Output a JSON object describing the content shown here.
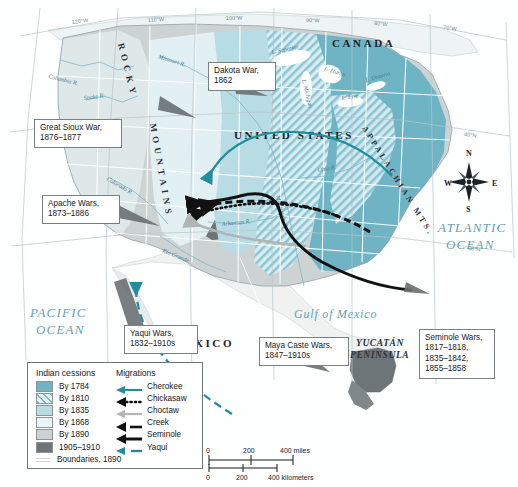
{
  "map": {
    "title": "Indian cessions and migrations map",
    "countries": [
      {
        "name": "CANADA",
        "x": 332,
        "y": 47
      },
      {
        "name": "UNITED STATES",
        "x": 234,
        "y": 139
      },
      {
        "name": "MEXICO",
        "x": 172,
        "y": 347
      }
    ],
    "oceans": [
      {
        "name": "PACIFIC",
        "x": 47,
        "y": 317
      },
      {
        "name": "OCEAN",
        "x": 50,
        "y": 333
      },
      {
        "name": "ATLANTIC",
        "x": 452,
        "y": 232
      },
      {
        "name": "OCEAN",
        "x": 458,
        "y": 248
      }
    ],
    "gulf": {
      "name": "Gulf of Mexico",
      "x": 298,
      "y": 316
    },
    "peninsula": [
      {
        "name": "YUCATÁN",
        "x": 365,
        "y": 345
      },
      {
        "name": "PENINSULA",
        "x": 360,
        "y": 357
      }
    ],
    "ranges": [
      {
        "name": "ROCKY",
        "x": 123,
        "y": 48
      },
      {
        "name": "MOUNTAINS",
        "x": 152,
        "y": 130
      },
      {
        "name": "APPALACHIAN MTS.",
        "x": 366,
        "y": 133
      }
    ],
    "rivers": [
      {
        "name": "Columbia R.",
        "x": 62,
        "y": 73
      },
      {
        "name": "Missouri R.",
        "x": 175,
        "y": 60
      },
      {
        "name": "Snake R.",
        "x": 90,
        "y": 95
      },
      {
        "name": "Colorado R.",
        "x": 122,
        "y": 185
      },
      {
        "name": "Rio Grande",
        "x": 178,
        "y": 258
      },
      {
        "name": "Mississippi R.",
        "x": 285,
        "y": 202
      },
      {
        "name": "Ohio R.",
        "x": 330,
        "y": 178
      },
      {
        "name": "L. Superior",
        "x": 290,
        "y": 57
      },
      {
        "name": "L. Michigan",
        "x": 305,
        "y": 95
      },
      {
        "name": "L. Huron",
        "x": 332,
        "y": 78
      },
      {
        "name": "L. Erie",
        "x": 348,
        "y": 104
      },
      {
        "name": "L. Ontario",
        "x": 378,
        "y": 88
      },
      {
        "name": "Arkansas R.",
        "x": 240,
        "y": 230
      }
    ],
    "longitudes": [
      {
        "label": "120°W",
        "x": 78,
        "y": 21
      },
      {
        "label": "110°W",
        "x": 155,
        "y": 21
      },
      {
        "label": "100°W",
        "x": 232,
        "y": 21
      },
      {
        "label": "90°W",
        "x": 312,
        "y": 21
      },
      {
        "label": "80°W",
        "x": 379,
        "y": 22
      },
      {
        "label": "70°W",
        "x": 448,
        "y": 23
      }
    ],
    "latitudes": [
      {
        "label": "40°N",
        "x": 470,
        "y": 134
      },
      {
        "label": "30°N",
        "x": 474,
        "y": 247
      }
    ],
    "compass": {
      "n": "N",
      "e": "E",
      "s": "S",
      "w": "W",
      "cx": 469,
      "cy": 182
    },
    "scale": {
      "miles_ticks": [
        "0",
        "200",
        "400 miles"
      ],
      "km_ticks": [
        "0",
        "200",
        "400 kilometers"
      ]
    },
    "colors": {
      "cession_1784": "#6fb4c4",
      "cession_1810": "#a9d4dd",
      "cession_1835": "#b8dce4",
      "cession_1868": "#dff0f4",
      "cession_1890": "#cdd2d2",
      "cession_1905": "#6e7578",
      "land_base": "#e9eff0",
      "water": "#ffffff",
      "accent_teal": "#1f8f9e",
      "migration_black": "#121212",
      "migration_gray": "#b0b5b6"
    }
  },
  "callouts": [
    {
      "id": "dakota-war",
      "text": "Dakota War,\n1862",
      "left": 208,
      "top": 62,
      "w": 66
    },
    {
      "id": "great-sioux-war",
      "text": "Great Sioux War,\n1876–1877",
      "left": 34,
      "top": 119,
      "w": 82
    },
    {
      "id": "apache-wars",
      "text": "Apache Wars,\n1873–1886",
      "left": 42,
      "top": 195,
      "w": 74
    },
    {
      "id": "yaqui-wars",
      "text": "Yaqui Wars,\n1832–1910s",
      "left": 124,
      "top": 325,
      "w": 72
    },
    {
      "id": "maya-caste-wars",
      "text": "Maya Caste Wars,\n1847–1910s",
      "left": 259,
      "top": 337,
      "w": 84
    },
    {
      "id": "seminole-wars",
      "text": "Seminole Wars,\n1817–1818,\n1835–1842,\n1855–1858",
      "left": 419,
      "top": 329,
      "w": 74
    }
  ],
  "legend": {
    "heading_cessions": "Indian cessions",
    "heading_migrations": "Migrations",
    "cessions": [
      {
        "label": "By 1784",
        "swatch": "#6fb4c4",
        "pattern": "solid"
      },
      {
        "label": "By 1810",
        "swatch": "#a9d4dd",
        "pattern": "hatch"
      },
      {
        "label": "By 1835",
        "swatch": "#b8dce4",
        "pattern": "solid"
      },
      {
        "label": "By 1868",
        "swatch": "#eaf6f8",
        "pattern": "solid"
      },
      {
        "label": "By 1890",
        "swatch": "#cdd2d2",
        "pattern": "solid"
      },
      {
        "label": "1905–1910",
        "swatch": "#6e7578",
        "pattern": "solid"
      }
    ],
    "boundaries": "Boundaries, 1890",
    "migrations": [
      {
        "label": "Cherokee",
        "color": "#1f8f9e",
        "style": "solid"
      },
      {
        "label": "Chickasaw",
        "color": "#121212",
        "style": "dotted"
      },
      {
        "label": "Choctaw",
        "color": "#b0b5b6",
        "style": "solid"
      },
      {
        "label": "Creek",
        "color": "#121212",
        "style": "dashed"
      },
      {
        "label": "Seminole",
        "color": "#121212",
        "style": "thick"
      },
      {
        "label": "Yaqui",
        "color": "#1f8f9e",
        "style": "dashed"
      }
    ]
  }
}
